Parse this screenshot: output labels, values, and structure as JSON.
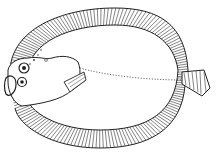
{
  "image": {
    "subject": "flatfish line drawing",
    "background": "#ffffff",
    "ink": "#222222"
  }
}
